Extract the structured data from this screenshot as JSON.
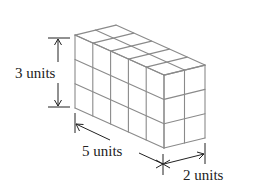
{
  "figure": {
    "type": "rectangular-prism-of-unit-cubes",
    "dimensions": {
      "length": 5,
      "width": 2,
      "height": 3
    },
    "labels": {
      "height": "3 units",
      "length": "5 units",
      "width": "2 units"
    },
    "colors": {
      "cube_edges": "#8a8a8a",
      "dimension_lines": "#222222",
      "text": "#222222",
      "background": "#ffffff"
    }
  }
}
